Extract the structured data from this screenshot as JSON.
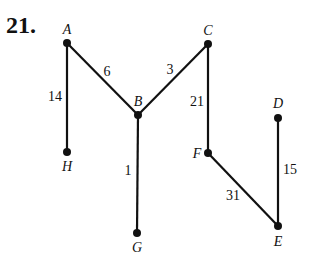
{
  "problem_number": "21.",
  "graph": {
    "nodes": [
      {
        "id": "A",
        "label": "A",
        "x": 67,
        "y": 43,
        "lx": 67,
        "ly": 34,
        "anchor": "middle"
      },
      {
        "id": "B",
        "label": "B",
        "x": 138,
        "y": 115,
        "lx": 138,
        "ly": 106,
        "anchor": "middle"
      },
      {
        "id": "C",
        "label": "C",
        "x": 208,
        "y": 44,
        "lx": 208,
        "ly": 35,
        "anchor": "middle"
      },
      {
        "id": "D",
        "label": "D",
        "x": 278,
        "y": 118,
        "lx": 278,
        "ly": 108,
        "anchor": "middle"
      },
      {
        "id": "H",
        "label": "H",
        "x": 67,
        "y": 152,
        "lx": 67,
        "ly": 171,
        "anchor": "middle"
      },
      {
        "id": "G",
        "label": "G",
        "x": 137,
        "y": 233,
        "lx": 137,
        "ly": 252,
        "anchor": "middle"
      },
      {
        "id": "F",
        "label": "F",
        "x": 208,
        "y": 153,
        "lx": 197,
        "ly": 158,
        "anchor": "middle"
      },
      {
        "id": "E",
        "label": "E",
        "x": 278,
        "y": 226,
        "lx": 278,
        "ly": 246,
        "anchor": "middle"
      }
    ],
    "edges": [
      {
        "from": "A",
        "to": "H",
        "weight": "14",
        "wx": 55,
        "wy": 101,
        "anchor": "middle"
      },
      {
        "from": "A",
        "to": "B",
        "weight": "6",
        "wx": 107,
        "wy": 76,
        "anchor": "middle"
      },
      {
        "from": "B",
        "to": "C",
        "weight": "3",
        "wx": 170,
        "wy": 74,
        "anchor": "middle"
      },
      {
        "from": "B",
        "to": "G",
        "weight": "1",
        "wx": 128,
        "wy": 175,
        "anchor": "middle"
      },
      {
        "from": "C",
        "to": "F",
        "weight": "21",
        "wx": 197,
        "wy": 106,
        "anchor": "middle"
      },
      {
        "from": "F",
        "to": "E",
        "weight": "31",
        "wx": 233,
        "wy": 200,
        "anchor": "middle"
      },
      {
        "from": "D",
        "to": "E",
        "weight": "15",
        "wx": 290,
        "wy": 174,
        "anchor": "middle"
      }
    ]
  }
}
